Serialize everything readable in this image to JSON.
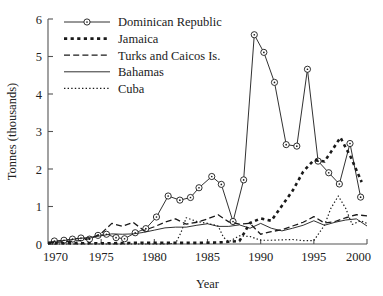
{
  "chart_data": {
    "type": "line",
    "title": "",
    "xlabel": "Year",
    "ylabel": "Tonnes (thousands)",
    "xlim": [
      1970,
      2000
    ],
    "ylim": [
      0,
      6
    ],
    "xticks": [
      1970,
      1975,
      1980,
      1985,
      1990,
      1995,
      2000
    ],
    "yticks": [
      0,
      1,
      2,
      3,
      4,
      5,
      6
    ],
    "grid": false,
    "legend_position": "top-left-inside",
    "series": [
      {
        "name": "Dominican Republic",
        "style": "solid-with-circle-markers",
        "x": [
          1970.6,
          1971.5,
          1972.3,
          1973.1,
          1973.9,
          1974.7,
          1975.5,
          1976.4,
          1977.2,
          1978.2,
          1979.2,
          1980.2,
          1981.3,
          1982.4,
          1983.4,
          1984.2,
          1985.4,
          1986.3,
          1987.4,
          1988.4,
          1989.4,
          1990.3,
          1991.3,
          1992.4,
          1993.4,
          1994.4,
          1995.4,
          1996.4,
          1997.4,
          1998.4,
          1999.4
        ],
        "values": [
          0.08,
          0.1,
          0.13,
          0.16,
          0.13,
          0.23,
          0.26,
          0.17,
          0.14,
          0.3,
          0.41,
          0.72,
          1.28,
          1.17,
          1.24,
          1.5,
          1.8,
          1.59,
          0.6,
          1.71,
          5.58,
          5.11,
          4.31,
          2.65,
          2.61,
          4.66,
          2.21,
          1.9,
          1.6,
          2.68,
          1.25
        ]
      },
      {
        "name": "Jamaica",
        "style": "thick-short-dash",
        "x": [
          1970,
          1972,
          1974,
          1976,
          1978,
          1980,
          1982,
          1984,
          1986,
          1987,
          1988,
          1989,
          1990,
          1991,
          1992,
          1993,
          1994,
          1995,
          1996,
          1996.6,
          1997.5,
          1998.5,
          1999.5
        ],
        "values": [
          0.02,
          0.02,
          0.02,
          0.02,
          0.03,
          0.03,
          0.03,
          0.03,
          0.04,
          0.06,
          0.08,
          0.56,
          0.68,
          0.62,
          1.02,
          1.42,
          1.93,
          2.24,
          2.2,
          2.45,
          2.84,
          2.3,
          1.65
        ]
      },
      {
        "name": "Turks and Caicos Is.",
        "style": "long-dash",
        "x": [
          1970,
          1971,
          1972,
          1973,
          1974,
          1975,
          1976,
          1977,
          1978,
          1979,
          1980,
          1981,
          1982,
          1983,
          1984,
          1985,
          1986,
          1987,
          1988,
          1989,
          1990,
          1991,
          1992,
          1993,
          1994,
          1995,
          1996,
          1997,
          1998,
          1999,
          2000
        ],
        "values": [
          0.04,
          0.05,
          0.07,
          0.09,
          0.15,
          0.28,
          0.55,
          0.47,
          0.58,
          0.36,
          0.46,
          0.58,
          0.67,
          0.53,
          0.58,
          0.67,
          0.78,
          0.59,
          0.53,
          0.55,
          0.26,
          0.33,
          0.38,
          0.48,
          0.58,
          0.73,
          0.56,
          0.6,
          0.7,
          0.78,
          0.75
        ]
      },
      {
        "name": "Bahamas",
        "style": "thin-solid",
        "x": [
          1970,
          1971,
          1972,
          1973,
          1974,
          1975,
          1976,
          1977,
          1978,
          1979,
          1980,
          1981,
          1982,
          1983,
          1984,
          1985,
          1986,
          1987,
          1988,
          1989,
          1990,
          1991,
          1992,
          1993,
          1994,
          1995,
          1996,
          1997,
          1998,
          1999,
          2000
        ],
        "values": [
          0.05,
          0.08,
          0.11,
          0.15,
          0.18,
          0.22,
          0.27,
          0.26,
          0.27,
          0.31,
          0.37,
          0.43,
          0.45,
          0.45,
          0.5,
          0.54,
          0.47,
          0.47,
          0.51,
          0.42,
          0.55,
          0.42,
          0.35,
          0.42,
          0.5,
          0.62,
          0.5,
          0.58,
          0.64,
          0.67,
          0.48
        ]
      },
      {
        "name": "Cuba",
        "style": "dotted",
        "x": [
          1970,
          1974,
          1978,
          1981,
          1982,
          1982.5,
          1983,
          1984,
          1985,
          1986,
          1986.5,
          1987,
          1988,
          1989,
          1990,
          1991,
          1992,
          1993,
          1994,
          1995,
          1996,
          1996.6,
          1997.3,
          1998,
          1998.6,
          1999.4,
          2000
        ],
        "values": [
          0.0,
          0.0,
          0.0,
          0.0,
          0.02,
          0.3,
          0.7,
          0.6,
          0.55,
          0.48,
          0.18,
          0.06,
          0.22,
          0.2,
          0.1,
          0.1,
          0.11,
          0.12,
          0.09,
          0.09,
          0.5,
          0.95,
          1.28,
          0.95,
          0.52,
          0.62,
          0.55
        ]
      }
    ],
    "legend": [
      {
        "label": "Dominican Republic",
        "style": "solid-with-circle-markers"
      },
      {
        "label": "Jamaica",
        "style": "thick-short-dash"
      },
      {
        "label": "Turks and Caicos Is.",
        "style": "long-dash"
      },
      {
        "label": "Bahamas",
        "style": "thin-solid"
      },
      {
        "label": "Cuba",
        "style": "dotted"
      }
    ],
    "colors": {
      "line": "#1a1a1a",
      "axis": "#555555",
      "text": "#222222",
      "background": "#ffffff"
    }
  }
}
